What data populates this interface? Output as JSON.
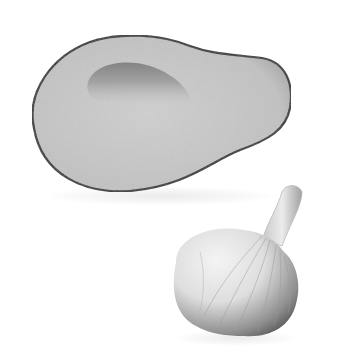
{
  "image": {
    "description": "Grayscale illustration of a halved avocado with the pit removed and a whole garlic bulb",
    "subjects": [
      {
        "name": "avocado-half",
        "tone": "#c8c8c8",
        "outline": "#3a3a3a",
        "cavity_shade": "#8a8a8a"
      },
      {
        "name": "garlic-bulb",
        "tone": "#e6e6e6",
        "shadow": "#5a5a5a"
      }
    ],
    "background": "#ffffff"
  }
}
